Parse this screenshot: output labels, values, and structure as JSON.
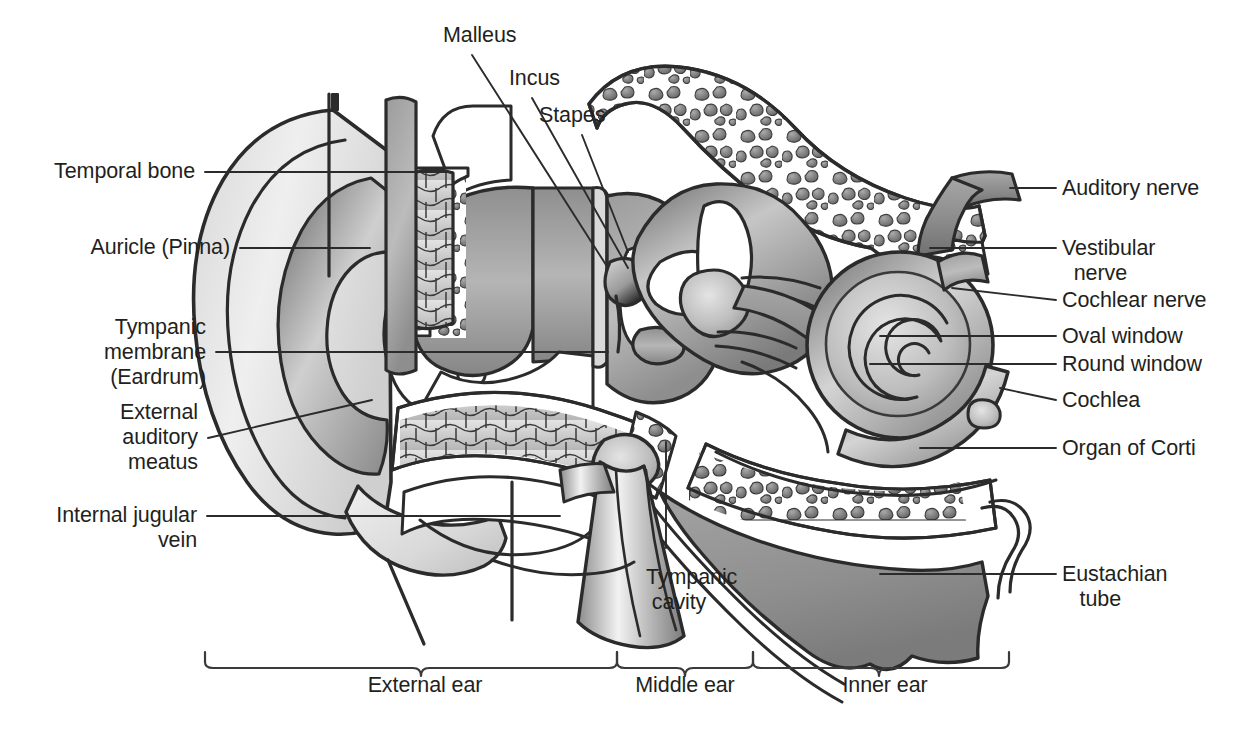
{
  "figure": {
    "background": "#ffffff",
    "ink": "#231f20"
  },
  "labels_left": [
    {
      "id": "temporal-bone",
      "text": "Temporal bone"
    },
    {
      "id": "auricle-pinna",
      "text": "Auricle (Pinna)"
    },
    {
      "id": "tympanic-membrane",
      "text": "Tympanic\nmembrane\n(Eardrum)"
    },
    {
      "id": "external-auditory-meatus",
      "text": "External\nauditory\nmeatus"
    },
    {
      "id": "internal-jugular-vein",
      "text": "Internal jugular\nvein"
    }
  ],
  "labels_top": [
    {
      "id": "malleus",
      "text": "Malleus"
    },
    {
      "id": "incus",
      "text": "Incus"
    },
    {
      "id": "stapes",
      "text": "Stapes"
    }
  ],
  "labels_right": [
    {
      "id": "auditory-nerve",
      "text": "Auditory nerve"
    },
    {
      "id": "vestibular-nerve",
      "text": "Vestibular\n  nerve"
    },
    {
      "id": "cochlear-nerve",
      "text": "Cochlear nerve"
    },
    {
      "id": "oval-window",
      "text": "Oval window"
    },
    {
      "id": "round-window",
      "text": "Round window"
    },
    {
      "id": "cochlea",
      "text": "Cochlea"
    },
    {
      "id": "organ-of-corti",
      "text": "Organ of Corti"
    },
    {
      "id": "eustachian-tube",
      "text": "Eustachian\n   tube"
    }
  ],
  "labels_bottom": [
    {
      "id": "tympanic-cavity",
      "text": "Tympanic\n cavity"
    }
  ],
  "regions": [
    {
      "id": "external-ear",
      "text": "External ear"
    },
    {
      "id": "middle-ear",
      "text": "Middle ear"
    },
    {
      "id": "inner-ear",
      "text": "Inner ear"
    }
  ],
  "palette": {
    "outline": "#2b2b2b",
    "light": "#e8e8e8",
    "mid": "#b9b9b9",
    "dark": "#8a8a8a",
    "darker": "#6d6d6d",
    "white": "#ffffff"
  }
}
